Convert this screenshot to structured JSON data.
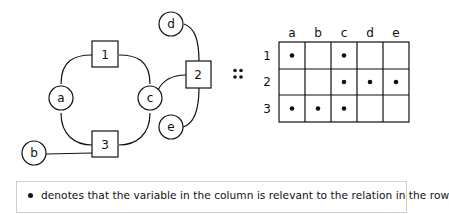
{
  "graph": {
    "variables": [
      "a",
      "b",
      "c",
      "d",
      "e"
    ],
    "relations": [
      "1",
      "2",
      "3"
    ],
    "edges": [
      [
        "1",
        "a"
      ],
      [
        "1",
        "c"
      ],
      [
        "2",
        "c"
      ],
      [
        "2",
        "d"
      ],
      [
        "2",
        "e"
      ],
      [
        "3",
        "a"
      ],
      [
        "3",
        "b"
      ],
      [
        "3",
        "c"
      ]
    ]
  },
  "equivalence_symbol": "::",
  "matrix": {
    "columns": [
      "a",
      "b",
      "c",
      "d",
      "e"
    ],
    "rows": [
      {
        "label": "1",
        "cells": [
          true,
          false,
          true,
          false,
          false
        ]
      },
      {
        "label": "2",
        "cells": [
          false,
          false,
          true,
          true,
          true
        ]
      },
      {
        "label": "3",
        "cells": [
          true,
          true,
          true,
          false,
          false
        ]
      }
    ]
  },
  "legend": {
    "text": "denotes that the variable in the column is relevant to the relation in the row"
  }
}
